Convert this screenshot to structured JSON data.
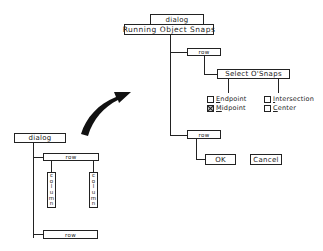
{
  "right_tree": {
    "dialog_label": "dialog",
    "title": "Running Object Snaps",
    "row1_label": "row",
    "group_label": "Select O'Snaps",
    "checkboxes": [
      {
        "label": "Endpoint",
        "mnemonic": "E",
        "rest": "ndpoint",
        "checked": false
      },
      {
        "label": "Midpoint",
        "mnemonic": "M",
        "rest": "idpoint",
        "checked": true
      },
      {
        "label": "Intersection",
        "mnemonic": "I",
        "rest": "ntersection",
        "checked": false
      },
      {
        "label": "Center",
        "mnemonic": "C",
        "rest": "enter",
        "checked": false
      }
    ],
    "row2_label": "row",
    "ok_label": "OK",
    "cancel_label": "Cancel"
  },
  "left_tree": {
    "dialog_label": "dialog",
    "row1_label": "row",
    "columns": [
      {
        "label": "column",
        "letters": [
          "c",
          "o",
          "l",
          "u",
          "m",
          "n"
        ]
      },
      {
        "label": "column",
        "letters": [
          "c",
          "o",
          "l",
          "u",
          "m",
          "n"
        ]
      }
    ],
    "row2_label": "row"
  },
  "arrow": {
    "direction": "left-tree-to-right-tree",
    "color": "#111111"
  }
}
